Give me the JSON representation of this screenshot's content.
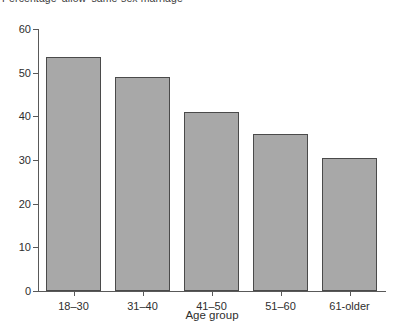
{
  "chart_data": {
    "type": "bar",
    "title": "Percentage 'allow' same-sex marriage",
    "xlabel": "Age group",
    "ylabel": "",
    "categories": [
      "18–30",
      "31–40",
      "41–50",
      "51–60",
      "61-older"
    ],
    "values": [
      53.5,
      49,
      41,
      36,
      30.5
    ],
    "ylim": [
      0,
      60
    ],
    "yticks": [
      0,
      10,
      20,
      30,
      40,
      50,
      60
    ],
    "ytick_labels": [
      "0",
      "10",
      "20",
      "30",
      "40",
      "50",
      "60"
    ],
    "grid": false,
    "legend": false,
    "colors": {
      "bar_fill": "#a8a8a8",
      "bar_border": "#4a4a4a",
      "axis": "#595959",
      "text": "#2e2e2e",
      "background": "#ffffff"
    }
  }
}
